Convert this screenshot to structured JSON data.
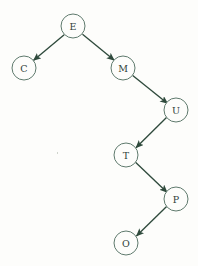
{
  "diagram": {
    "title": "",
    "type": "binary-search-tree",
    "background_color": "#fdfdfb",
    "node_stroke_color": "#5f7a6d",
    "node_fill_color": "#fdfdfb",
    "edge_color": "#2f4a3c",
    "label_color": "#2f4038",
    "node_radius": 12,
    "nodes": [
      {
        "id": "E",
        "label": "E",
        "cx": 73,
        "cy": 26
      },
      {
        "id": "C",
        "label": "C",
        "cx": 24,
        "cy": 68
      },
      {
        "id": "M",
        "label": "M",
        "cx": 123,
        "cy": 68
      },
      {
        "id": "U",
        "label": "U",
        "cx": 176,
        "cy": 110
      },
      {
        "id": "T",
        "label": "T",
        "cx": 126,
        "cy": 155
      },
      {
        "id": "P",
        "label": "P",
        "cx": 176,
        "cy": 199
      },
      {
        "id": "O",
        "label": "O",
        "cx": 126,
        "cy": 243
      }
    ],
    "edges": [
      {
        "from": "E",
        "to": "C",
        "direction": "down-left",
        "arrow": true
      },
      {
        "from": "E",
        "to": "M",
        "direction": "down-right",
        "arrow": true
      },
      {
        "from": "M",
        "to": "U",
        "direction": "down-right",
        "arrow": true
      },
      {
        "from": "U",
        "to": "T",
        "direction": "down-left",
        "arrow": true
      },
      {
        "from": "T",
        "to": "P",
        "direction": "down-right",
        "arrow": true
      },
      {
        "from": "P",
        "to": "O",
        "direction": "down-left",
        "arrow": true
      }
    ]
  }
}
